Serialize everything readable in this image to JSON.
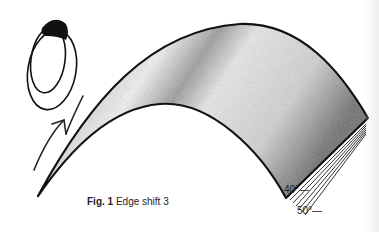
{
  "figure": {
    "caption_label": "Fig. 1",
    "caption_text": "Edge shift 3",
    "angle_labels": [
      "40°—",
      "50°—"
    ]
  },
  "colors": {
    "outline": "#111111",
    "shading_dark": "#555555",
    "shading_light": "#e6e6e6",
    "background": "#ffffff"
  },
  "icons": [
    "eye-ellipse-icon",
    "curved-arrow-icon"
  ]
}
